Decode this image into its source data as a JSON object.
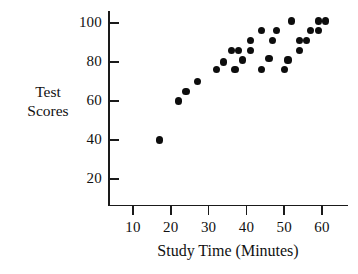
{
  "chart_data": {
    "type": "scatter",
    "title": "",
    "xlabel": "Study Time (Minutes)",
    "ylabel": "Test Scores",
    "ylabel_lines": [
      "Test",
      "Scores"
    ],
    "xlim": [
      5,
      68
    ],
    "ylim": [
      0,
      107
    ],
    "xticks": [
      10,
      20,
      30,
      40,
      50,
      60
    ],
    "yticks": [
      20,
      40,
      60,
      80,
      100
    ],
    "xtick_labels": [
      "10",
      "20",
      "30",
      "40",
      "50",
      "60"
    ],
    "ytick_labels": [
      "20",
      "40",
      "60",
      "80",
      "100"
    ],
    "grid": false,
    "legend": false,
    "marker": "filled-circle",
    "marker_color": "#0d0d0d",
    "points": [
      {
        "x": 17,
        "y": 40
      },
      {
        "x": 22,
        "y": 60
      },
      {
        "x": 24,
        "y": 65
      },
      {
        "x": 27,
        "y": 70
      },
      {
        "x": 32,
        "y": 76
      },
      {
        "x": 34,
        "y": 80
      },
      {
        "x": 36,
        "y": 86
      },
      {
        "x": 37,
        "y": 76
      },
      {
        "x": 38,
        "y": 86
      },
      {
        "x": 39,
        "y": 81
      },
      {
        "x": 41,
        "y": 91
      },
      {
        "x": 41,
        "y": 86
      },
      {
        "x": 44,
        "y": 96
      },
      {
        "x": 44,
        "y": 76
      },
      {
        "x": 46,
        "y": 82
      },
      {
        "x": 47,
        "y": 91
      },
      {
        "x": 48,
        "y": 96
      },
      {
        "x": 50,
        "y": 76
      },
      {
        "x": 51,
        "y": 81
      },
      {
        "x": 52,
        "y": 101
      },
      {
        "x": 54,
        "y": 86
      },
      {
        "x": 54,
        "y": 91
      },
      {
        "x": 56,
        "y": 91
      },
      {
        "x": 57,
        "y": 96
      },
      {
        "x": 59,
        "y": 101
      },
      {
        "x": 59,
        "y": 96
      },
      {
        "x": 61,
        "y": 101
      }
    ]
  }
}
